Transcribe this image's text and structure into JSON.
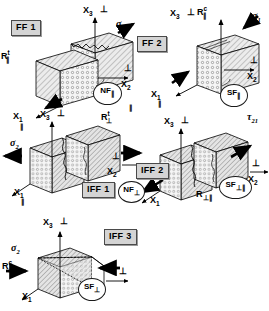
{
  "figure": {
    "type": "technical-diagram",
    "panel_count": 5
  },
  "symbols": {
    "perp": "⊥",
    "par": "∥",
    "sigma": "σ",
    "tau": "τ"
  },
  "panels": [
    {
      "id": "ff1",
      "mode_box": "FF 1",
      "axes": {
        "x1": "X",
        "x1_sub": "1",
        "x2": "X",
        "x2_sub": "2",
        "x3": "X",
        "x3_sub": "3"
      },
      "x3_perp": "⊥",
      "x2_perp": "⊥",
      "x1_perp": "∥",
      "stress": {
        "glyph": "σ",
        "sub": "1",
        "sense": "tension"
      },
      "strength": {
        "base": "R",
        "sup": "t",
        "sub": "∥"
      },
      "tag": {
        "base": "NF",
        "sub": "∥"
      }
    },
    {
      "id": "ff2",
      "mode_box": "FF 2",
      "axes": {
        "x1": "X",
        "x1_sub": "1",
        "x2": "X",
        "x2_sub": "2",
        "x3": "X",
        "x3_sub": "3"
      },
      "x3_perp": "⊥",
      "x2_perp": "⊥",
      "x1_perp": "∥",
      "stress": {
        "glyph": "σ",
        "sub": "1",
        "sense": "compression"
      },
      "strength": {
        "base": "R",
        "sup": "c",
        "sub": "∥"
      },
      "tag": {
        "base": "SF",
        "sub": "∥"
      }
    },
    {
      "id": "iff1",
      "mode_box": "IFF 1",
      "axes": {
        "x1": "X",
        "x1_sub": "1",
        "x2": "X",
        "x2_sub": "2",
        "x3": "X",
        "x3_sub": "3"
      },
      "x3_perp": "⊥",
      "x2_perp": "⊥",
      "x1_perp": "∥",
      "stress": {
        "glyph": "σ",
        "sub": "2",
        "sense": "tension"
      },
      "strength": {
        "base": "R",
        "sup": "t",
        "sub": "⊥"
      },
      "tag": {
        "base": "NF",
        "sub": "⊥"
      }
    },
    {
      "id": "iff2",
      "mode_box": "IFF 2",
      "axes": {
        "x1": "X",
        "x1_sub": "1",
        "x2": "X",
        "x2_sub": "2",
        "x3": "X",
        "x3_sub": "3"
      },
      "x3_perp": "⊥",
      "x2_perp": "⊥",
      "x1_perp": "∥",
      "stress": {
        "glyph": "τ",
        "sub": "21",
        "sense": "shear"
      },
      "strength": {
        "base": "R",
        "sup": "",
        "sub": "⊥∥"
      },
      "tag": {
        "base": "SF",
        "sub": "⊥∥"
      }
    },
    {
      "id": "iff3",
      "mode_box": "IFF 3",
      "axes": {
        "x1": "X",
        "x1_sub": "1",
        "x2": "X",
        "x2_sub": "2",
        "x3": "X",
        "x3_sub": "3"
      },
      "x3_perp": "⊥",
      "x2_perp": "⊥",
      "x1_perp": "",
      "stress": {
        "glyph": "σ",
        "sub": "2",
        "sense": "compression"
      },
      "strength": {
        "base": "R",
        "sup": "c",
        "sub": "⊥"
      },
      "tag": {
        "base": "SF",
        "sub": "⊥"
      }
    }
  ],
  "colors": {
    "line": "#000000",
    "hatch_fill": "#e8e8e8",
    "fibre_face": "#f4f4f4",
    "mode_box_bg": "#d4d4d4",
    "mode_box_border": "#4a4a4a"
  }
}
